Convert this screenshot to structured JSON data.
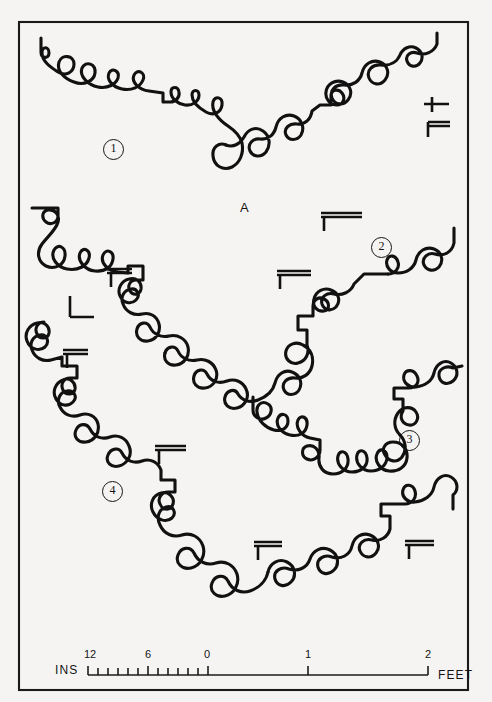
{
  "figure": {
    "kind": "suture-line-plate",
    "background_color": "#f6f4f3",
    "ink_color": "#111111",
    "frame": {
      "x": 19,
      "y": 22,
      "width": 449,
      "height": 668
    }
  },
  "specimen_labels": [
    {
      "id": "suture-1",
      "text": "1",
      "x": 103,
      "y": 139
    },
    {
      "id": "suture-2",
      "text": "2",
      "x": 371,
      "y": 237
    },
    {
      "id": "suture-3",
      "text": "3",
      "x": 399,
      "y": 430
    },
    {
      "id": "suture-4",
      "text": "4",
      "x": 102,
      "y": 481
    }
  ],
  "point_labels": [
    {
      "id": "point-a",
      "text": "A",
      "x": 240,
      "y": 200
    }
  ],
  "scale_bar": {
    "left_unit_label": "INS",
    "right_unit_label": "FEET",
    "inch_ticks": [
      12,
      11,
      10,
      9,
      8,
      7,
      6,
      5,
      4,
      3,
      2,
      1,
      0
    ],
    "inch_labels": [
      {
        "text": "12",
        "value": 12
      },
      {
        "text": "6",
        "value": 6
      },
      {
        "text": "0",
        "value": 0
      }
    ],
    "feet_labels": [
      {
        "text": "1",
        "value": 1
      },
      {
        "text": "2",
        "value": 2
      }
    ],
    "axis_y": 675,
    "zero_x": 208,
    "inch_start_x": 88,
    "foot_1_x": 308,
    "foot_2_x": 428,
    "tick_height": 7
  },
  "chart_data": {
    "type": "line",
    "title": "",
    "xlabel": "",
    "ylabel": "",
    "series": [
      {
        "name": "1",
        "label_position": {
          "x": 103,
          "y": 139
        },
        "path": "M 41 38 L 41 52 C 41 59 49 59 49 53 C 49 46 42 46 42 53 C 42 62 52 68 58 72 C 66 77 74 72 74 64 C 74 55 62 54 59 62 C 56 71 65 79 74 82 C 84 86 94 81 95 73 C 96 64 86 60 82 68 C 79 76 88 85 98 87 C 108 89 116 84 118 78 C 120 71 112 67 109 73 C 106 80 113 87 122 89 C 132 91 140 87 143 80 C 146 73 138 68 134 75 C 131 82 139 90 149 91 L 163 93 L 163 102 L 170 102 C 176 102 180 97 179 92 C 178 86 171 86 171 92 C 171 99 178 104 185 105 C 193 106 199 101 199 95 C 199 89 192 89 192 95 C 192 102 199 108 206 112 C 213 116 221 113 222 105 C 223 97 215 95 213 102 C 211 111 219 120 228 126 C 234 130 240 135 242 143 C 244 153 240 163 232 167 C 223 171 214 166 213 156 C 212 147 219 142 226 145",
        "reversed_branch": "M 226 145 C 233 148 240 144 244 137 C 248 129 256 126 263 131 C 270 136 271 145 266 152 C 261 158 253 157 250 151 C 247 144 253 138 260 139 C 268 140 274 135 276 127 C 278 118 286 113 294 116 C 302 119 305 128 301 135 C 297 141 289 141 286 135 C 283 128 290 123 297 124 C 305 125 311 119 312 111 L 320 105 L 331 105 L 331 96 C 331 90 338 88 342 93 C 346 98 343 105 337 105 C 330 105 325 99 326 92 C 327 84 335 79 343 82 C 351 85 353 94 348 100 C 343 106 335 105 332 98 C 329 90 336 84 344 85 C 353 86 360 81 362 73 C 364 64 372 59 380 62 C 388 65 390 74 385 80 C 380 86 372 85 369 78 C 366 70 373 64 381 65 C 390 66 397 62 400 55 C 403 48 410 45 416 48 C 422 51 424 58 420 63 C 416 68 409 67 407 61 C 405 55 411 51 417 53 C 425 56 434 52 437 44 L 437 33"
      },
      {
        "name": "2",
        "label_position": {
          "x": 371,
          "y": 237
        },
        "path": "M 32 208 L 58 208 L 58 216 C 58 222 51 226 46 222 C 41 218 42 211 48 210 C 55 209 60 215 58 222 C 56 230 48 236 42 244 C 36 252 38 262 46 266 C 55 270 64 265 65 256 C 66 247 58 243 54 250 C 50 258 57 267 67 269 C 78 271 87 266 89 258 C 91 250 83 246 80 253 C 77 261 85 270 95 271 C 105 272 112 267 113 259 C 114 251 106 248 103 255 C 100 263 108 271 118 272 L 128 273 L 128 266 L 143 266 L 143 280 L 136 280 C 130 280 127 286 130 291 C 133 296 140 295 141 289 C 142 282 136 277 129 279 C 121 281 117 289 120 296 C 123 303 131 305 136 300 C 141 295 137 288 131 289 C 124 290 120 297 123 304 C 126 312 134 316 142 314 C 150 312 157 316 159 324 C 161 332 156 340 148 341 C 140 342 135 336 137 329 C 139 322 147 321 150 327 C 153 334 161 338 169 336 C 178 334 186 339 188 347 C 190 356 184 364 176 365 C 168 366 163 360 165 353",
        "reversed_branch": "M 165 353 C 167 346 175 345 178 351 C 181 358 189 362 197 360 C 205 358 213 362 216 370 C 219 379 213 387 205 388 C 197 389 192 383 194 376 C 196 369 204 368 207 374 C 211 382 219 384 227 381 C 235 378 243 382 246 389 C 250 397 245 406 237 408 C 229 410 223 404 225 397 C 227 390 235 388 238 394 C 242 401 250 403 258 400 C 266 397 273 391 275 383 C 277 374 285 369 292 372 C 300 375 303 383 299 390 C 295 396 287 396 284 390 C 281 383 287 377 295 378 C 303 379 310 374 312 366 C 314 357 311 349 303 345 C 296 341 288 344 286 351 C 284 359 291 365 298 363 C 306 361 310 353 307 345 L 307 330 L 298 330 L 298 316 L 313 316 L 313 306 C 313 300 319 296 324 299 C 330 302 330 310 324 311 C 317 312 312 306 314 299 C 316 291 324 287 331 290 C 339 293 341 301 336 307 C 331 312 324 310 322 304 C 320 297 327 292 334 294 C 342 296 351 292 354 284 L 364 274 L 388 274",
        "extra_branch": "M 388 274 C 395 274 400 268 398 262 C 396 255 389 254 387 260 C 385 267 391 273 398 273 C 407 273 414 268 416 260 C 418 251 426 246 434 249 C 442 252 444 261 439 267 C 434 272 427 271 424 265 C 421 258 428 252 435 254 C 444 257 452 252 454 243 L 454 228"
      },
      {
        "name": "3",
        "label_position": {
          "x": 399,
          "y": 430
        },
        "path": "M 253 397 L 253 410 C 253 417 260 421 266 418 C 272 415 273 407 268 404 C 262 400 256 405 257 412 C 258 421 266 428 274 430 C 282 432 288 428 288 421 C 288 414 281 412 278 418 C 275 425 281 433 290 435 C 299 437 306 433 307 425 C 308 417 301 414 298 420 C 295 427 301 436 310 438 L 320 440 L 320 450 C 320 457 313 462 307 459 C 301 456 301 448 307 446 C 314 444 320 450 319 458 C 318 467 324 474 333 474 C 342 474 349 468 348 459 C 347 451 340 449 338 456 C 336 464 343 472 352 472 C 361 472 368 466 367 458 C 366 450 359 448 357 455 C 355 463 362 471 371 471 C 380 471 387 465 387 457 C 387 450 380 447 377 454 C 374 461 380 470 389 471 C 398 472 406 467 407 458 C 408 449 402 442 393 442 C 385 442 381 449 385 455 C 389 462 397 463 402 457 C 407 450 406 441 400 435",
        "reversed_branch": "M 400 435 C 394 429 393 420 398 413 C 403 406 412 406 416 412 C 420 418 416 426 409 425 C 402 424 399 417 403 411 L 403 399 L 394 399 L 394 388 L 409 388 C 416 388 420 382 417 376 C 414 369 406 369 404 375 C 402 382 409 388 416 387 C 425 386 432 381 434 373 C 436 364 444 359 451 363 C 458 367 459 376 453 381 C 447 386 440 383 439 376 C 438 369 446 365 453 368 L 462 366"
      },
      {
        "name": "4",
        "label_position": {
          "x": 102,
          "y": 481
        },
        "path": "M 44 322 C 38 322 34 328 37 334 C 40 340 48 339 49 333 C 50 326 44 321 37 323 C 29 325 24 333 27 341 C 30 349 39 352 45 347 C 50 342 47 334 40 335 C 33 336 29 343 32 350 C 35 358 43 362 51 360 L 62 357 L 62 366 L 77 366 L 77 378 L 70 378 C 64 378 60 384 63 390 C 66 396 74 395 75 389 C 76 382 69 377 63 380 C 55 383 52 392 56 399 C 60 406 68 407 73 402 C 78 397 74 390 67 391 C 60 392 56 400 60 407 C 64 415 72 418 80 415 C 88 412 96 416 98 424 C 100 433 94 441 86 442 C 78 443 73 437 76 430 C 79 423 87 423 90 429 C 94 437 102 440 110 437 C 118 434 126 438 129 446 C 133 455 127 464 119 466 C 111 468 105 462 108 455 C 111 448 119 447 122 453 C 126 461 134 464 142 461 C 150 458 158 462 161 470 L 161 480 L 175 480 L 175 492 L 168 492 C 162 492 157 498 160 504 C 163 511 171 511 173 504 C 175 497 168 491 161 493 C 153 495 149 504 153 512 C 157 520 166 523 172 518 C 177 513 173 505 166 507 C 159 509 156 517 160 525 C 164 534 173 538 182 535 C 191 532 200 537 203 546 C 206 556 200 566 191 568 C 182 570 175 563 178 555 C 181 547 190 546 194 553 C 198 562 207 566 216 563 C 225 560 234 565 237 574 C 240 584 234 594 225 596 C 216 598 209 591 212 583 C 215 575 224 574 228 581 C 232 590 241 594 250 591 C 259 588 266 581 268 572",
        "reversed_branch": "M 268 572 C 270 563 279 558 287 562 C 295 566 297 576 291 582 C 285 588 277 586 275 579 C 273 571 281 566 289 569 C 298 572 307 568 310 559 C 313 550 322 546 330 550 C 338 554 340 564 334 570 C 328 576 320 574 318 567 C 316 559 324 554 332 557 C 341 560 350 555 352 546 C 354 537 362 532 370 535 C 378 538 381 547 376 553 C 371 559 363 558 360 551 C 357 544 364 538 372 540 C 380 542 388 537 390 529 L 390 516 L 381 516 L 381 504 L 405 504 C 412 504 417 498 415 491 C 413 484 405 483 403 490 C 401 497 408 503 415 502 C 424 501 432 496 434 487 C 436 478 444 473 451 477 C 458 481 459 490 453 495 L 453 509"
      }
    ]
  },
  "tick_marks": [
    {
      "id": "tick-1a",
      "path": "M 432 97 L 432 112 M 424 104 L 449 104"
    },
    {
      "id": "tick-1b",
      "path": "M 428 126 L 450 126 M 428 122 L 450 122 M 428 122 L 428 137"
    },
    {
      "id": "tick-1c",
      "path": "M 321 213 L 362 213 M 321 217 L 362 217 M 324 217 L 324 231"
    },
    {
      "id": "tick-2a",
      "path": "M 107 269 L 132 269 M 107 273 L 132 273 M 111 273 L 111 287"
    },
    {
      "id": "tick-2b",
      "path": "M 277 271 L 311 271 M 277 275 L 311 275 M 280 275 L 280 289"
    },
    {
      "id": "tick-3a",
      "path": "M 70 296 L 70 317 M 70 317 L 94 317"
    },
    {
      "id": "tick-4a",
      "path": "M 63 350 L 88 350 M 63 354 L 88 354 M 67 354 L 67 368"
    },
    {
      "id": "tick-4b",
      "path": "M 155 446 L 186 446 M 155 450 L 186 450 M 159 450 L 159 464"
    },
    {
      "id": "tick-4c",
      "path": "M 254 542 L 282 542 M 254 546 L 282 546 M 258 546 L 258 560"
    },
    {
      "id": "tick-3b",
      "path": "M 405 541 L 434 541 M 405 545 L 434 545 M 409 545 L 409 559"
    }
  ]
}
